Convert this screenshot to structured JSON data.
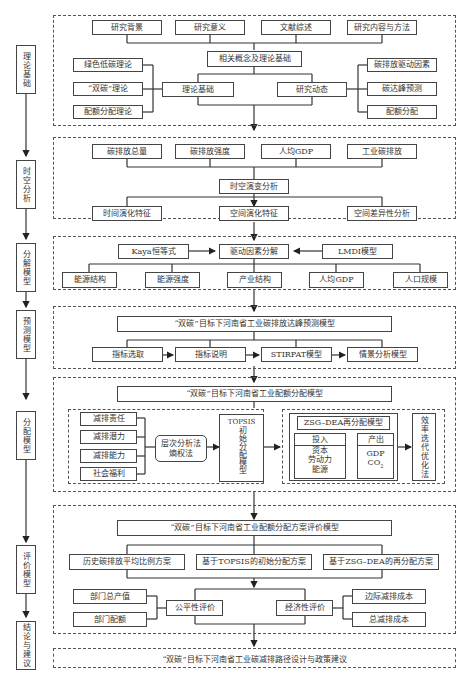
{
  "stages": [
    "理论基础",
    "时空分析",
    "分解模型",
    "预测模型",
    "分配模型",
    "评价模型",
    "结论与建议"
  ],
  "theory": {
    "top": [
      "研究背景",
      "研究意义",
      "文献综述",
      "研究内容与方法"
    ],
    "center": "相关概念及理论基础",
    "left_group": [
      "绿色低碳理论",
      "“双碳”理论",
      "配额分配理论"
    ],
    "left_hub": "理论基础",
    "right_hub": "研究动态",
    "right_group": [
      "碳排放驱动因素",
      "碳达峰预测",
      "配额分配"
    ]
  },
  "spatiotemporal": {
    "top": [
      "碳排放总量",
      "碳排放强度",
      "人均GDP",
      "工业碳排放"
    ],
    "center": "时空演变分析",
    "bottom": [
      "时间演化特征",
      "空间演化特征",
      "空间差异性分析"
    ]
  },
  "decomposition": {
    "left": "Kaya恒等式",
    "center": "驱动因素分解",
    "right": "LMDI模型",
    "factors": [
      "能源结构",
      "能源强度",
      "产业结构",
      "人均GDP",
      "人口规模"
    ]
  },
  "prediction": {
    "title": "“双碳”目标下河南省工业碳排放达峰预测模型",
    "steps": [
      "指标选取",
      "指标说明",
      "STIRPAT模型",
      "情景分析模型"
    ]
  },
  "allocation": {
    "title": "“双碳”目标下河南省工业配额分配模型",
    "criteria": [
      "减排责任",
      "减排潜力",
      "减排能力",
      "社会福利"
    ],
    "weighting_line1": "层次分析法",
    "weighting_line2": "熵权法",
    "topsis_label": "TOPSIS",
    "topsis_vertical": "初始分配模型",
    "zsg_title": "ZSG–DEA再分配模型",
    "input_label": "投入",
    "input_items": [
      "资本",
      "劳动力",
      "能源"
    ],
    "output_label": "产出",
    "output_items": [
      "GDP",
      "CO"
    ],
    "co2_sub": "2",
    "iteration": "效率迭代优化法"
  },
  "evaluation": {
    "title": "“双碳”目标下河南省工业配额分配方案评价模型",
    "schemes": [
      "历史碳排放平均比例方案",
      "基于TOPSIS的初始分配方案",
      "基于ZSG–DEA的再分配方案"
    ],
    "fairness_inputs": [
      "部门总产值",
      "部门配额"
    ],
    "fairness": "公平性评价",
    "economic": "经济性评价",
    "economic_inputs": [
      "边际减排成本",
      "总减排成本"
    ]
  },
  "conclusion": {
    "text": "“双碳”目标下河南省工业碳减排路径设计与政策建议"
  }
}
